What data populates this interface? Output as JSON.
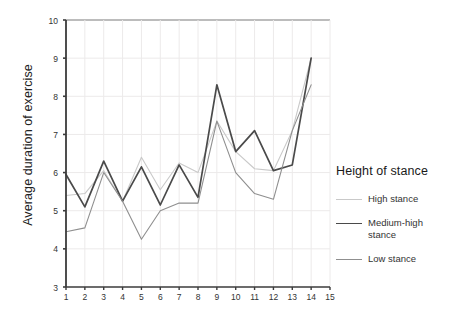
{
  "chart_data": {
    "type": "line",
    "title": "",
    "xlabel": "",
    "ylabel": "Average duration of exercise",
    "xlim": [
      1,
      15
    ],
    "ylim": [
      3,
      10
    ],
    "grid": true,
    "legend_position": "right",
    "legend_title": "Height of stance",
    "x": [
      1,
      2,
      3,
      4,
      5,
      6,
      7,
      8,
      9,
      10,
      11,
      12,
      13,
      14
    ],
    "xticks": [
      1,
      2,
      3,
      4,
      5,
      6,
      7,
      8,
      9,
      10,
      11,
      12,
      13,
      14,
      15
    ],
    "xtick_labels": [
      "1",
      "2",
      "3",
      "4",
      "5",
      "6",
      "7",
      "8",
      "9",
      "10",
      "11",
      "12",
      "13",
      "14",
      "15"
    ],
    "yticks": [
      3,
      4,
      5,
      6,
      7,
      8,
      9,
      10
    ],
    "ytick_labels": [
      "3",
      "4",
      "5",
      "6",
      "7",
      "8",
      "9",
      "10"
    ],
    "series": [
      {
        "name": "High stance",
        "color": "#c9c9c9",
        "width": 1.1,
        "values": [
          5.4,
          5.45,
          6.05,
          5.25,
          6.4,
          5.55,
          6.25,
          6.0,
          7.35,
          6.55,
          6.1,
          6.05,
          7.1,
          9.0
        ]
      },
      {
        "name": "Medium-high stance",
        "color": "#4a4a4a",
        "width": 1.7,
        "values": [
          5.95,
          5.1,
          6.3,
          5.25,
          6.15,
          5.15,
          6.2,
          5.35,
          8.3,
          6.55,
          7.1,
          6.05,
          6.2,
          9.0
        ]
      },
      {
        "name": "Low stance",
        "color": "#8f8f8f",
        "width": 1.1,
        "values": [
          4.45,
          4.55,
          6.0,
          5.25,
          4.25,
          5.0,
          5.2,
          5.2,
          7.35,
          6.0,
          5.45,
          5.3,
          7.1,
          8.3
        ]
      }
    ]
  },
  "legend": {
    "title": "Height of stance",
    "items": [
      {
        "label": "High stance"
      },
      {
        "label": "Medium-high stance"
      },
      {
        "label": "Low stance"
      }
    ]
  },
  "axis": {
    "y_title": "Average duration of exercise"
  },
  "colors": {
    "axis": "#3b3b3b",
    "grid": "#eceaea",
    "top_border": "#7a7a7a",
    "text": "#333333"
  }
}
